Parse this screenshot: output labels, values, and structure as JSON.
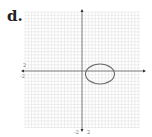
{
  "problem_label": "d.",
  "graph": {
    "x_axis_labels": {
      "pos": "2",
      "neg": "-2"
    },
    "y_axis_labels": {
      "neg": "-2",
      "pos": "2"
    },
    "grid_color": "#d8d8d8",
    "axis_color": "#555555",
    "curve_color": "#6b6b6b",
    "curve": "ellipse",
    "curve_center_units": [
      2.5,
      0
    ],
    "curve_radii_units": [
      2.2,
      1.4
    ]
  }
}
